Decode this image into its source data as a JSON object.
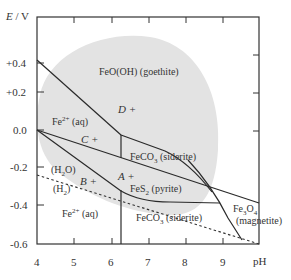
{
  "diagram": {
    "type": "Pourbaix (E-pH) diagram",
    "y_axis": {
      "label_var": "E",
      "label_unit": " / V",
      "ticks": [
        "+0.4",
        "+0.2",
        "0.0",
        "-0.2",
        "-0.4",
        "-0.6"
      ]
    },
    "x_axis": {
      "label": "pH",
      "ticks": [
        "4",
        "5",
        "6",
        "7",
        "8",
        "9"
      ]
    },
    "regions": {
      "goethite": "FeO(OH) (goethite)",
      "fe2_upper": {
        "base": "Fe",
        "sup": "2+",
        "tail": " (aq)"
      },
      "siderite_upper": {
        "base": "FeCO",
        "sub": "3",
        "tail": " (siderite)"
      },
      "pyrite": {
        "base": "FeS",
        "sub": "2",
        "tail": " (pyrite)"
      },
      "fe2_lower": {
        "base": "Fe",
        "sup": "2+",
        "tail": " (aq)"
      },
      "siderite_lower": {
        "base": "FeCO",
        "sub": "3",
        "tail": " (siderite)"
      },
      "magnetite": {
        "base1": "Fe",
        "sub1": "3",
        "base2": "O",
        "sub2": "4",
        "tail": "(magnetite)"
      },
      "water": {
        "open": "(H",
        "sub": "2",
        "close": "O)"
      },
      "hydrogen": {
        "open": "(H",
        "sub": "2",
        "close": ")"
      }
    },
    "points": {
      "A": "A +",
      "B": "B +",
      "C": "C +",
      "D": "D +"
    },
    "colors": {
      "shaded_region": "#e3e3e3",
      "lines": "#2a2a2a",
      "axis": "#333333"
    }
  }
}
